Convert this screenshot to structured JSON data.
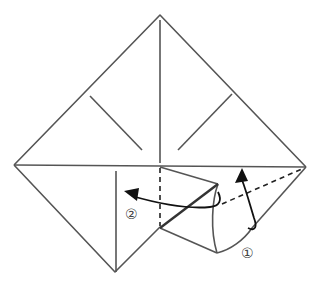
{
  "diagram": {
    "type": "origami-fold-instruction",
    "steps": [
      {
        "label": "①",
        "description": "fold flap up along dashed line"
      },
      {
        "label": "②",
        "description": "fold flap left along dashed line"
      }
    ],
    "colors": {
      "line": "#555555",
      "arrow": "#111111",
      "background": "#ffffff"
    }
  }
}
